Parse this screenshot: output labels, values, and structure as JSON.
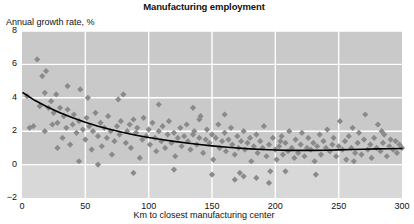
{
  "chart_data": {
    "type": "scatter",
    "title": "Manufacturing employment",
    "xlabel": "Km to closest manufacturing center",
    "ylabel": "Annual growth rate, %",
    "xlim": [
      0,
      300
    ],
    "ylim": [
      -2,
      8
    ],
    "xticks": [
      0,
      50,
      100,
      150,
      200,
      250,
      300
    ],
    "xtick_labels": [
      "0",
      "50",
      "100",
      "150",
      "200",
      "250",
      "300"
    ],
    "yticks": [
      -2,
      0,
      2,
      4,
      6,
      8
    ],
    "ytick_labels": [
      "−2",
      "0",
      "2",
      "4",
      "6",
      "8"
    ],
    "grid": true,
    "grid_color": "#ffffff",
    "plot_bg": "#c9c9c9",
    "plot_bg_below_zero": "#d8d8d8",
    "marker_shape": "diamond",
    "marker_color": "#8a8a8a",
    "marker_size": 5,
    "legend": null,
    "series": [
      {
        "name": "Municipalities",
        "points": [
          [
            4,
            4.1
          ],
          [
            6,
            2.2
          ],
          [
            9,
            2.3
          ],
          [
            12,
            6.3
          ],
          [
            14,
            3.5
          ],
          [
            16,
            5.3
          ],
          [
            18,
            2.0
          ],
          [
            19,
            5.6
          ],
          [
            21,
            3.4
          ],
          [
            23,
            3.8
          ],
          [
            24,
            2.4
          ],
          [
            25,
            3.1
          ],
          [
            27,
            4.2
          ],
          [
            28,
            2.5
          ],
          [
            30,
            3.4
          ],
          [
            32,
            1.6
          ],
          [
            33,
            2.9
          ],
          [
            35,
            2.2
          ],
          [
            36,
            3.3
          ],
          [
            38,
            1.2
          ],
          [
            40,
            2.4
          ],
          [
            41,
            3.0
          ],
          [
            43,
            1.9
          ],
          [
            45,
            2.6
          ],
          [
            46,
            4.5
          ],
          [
            48,
            2.1
          ],
          [
            50,
            1.5
          ],
          [
            51,
            2.8
          ],
          [
            53,
            2.3
          ],
          [
            55,
            0.9
          ],
          [
            56,
            2.0
          ],
          [
            58,
            3.1
          ],
          [
            60,
            1.7
          ],
          [
            62,
            2.5
          ],
          [
            63,
            1.1
          ],
          [
            65,
            2.2
          ],
          [
            67,
            1.6
          ],
          [
            68,
            2.9
          ],
          [
            70,
            2.0
          ],
          [
            71,
            0.6
          ],
          [
            73,
            1.4
          ],
          [
            75,
            2.3
          ],
          [
            77,
            1.8
          ],
          [
            78,
            2.6
          ],
          [
            80,
            4.2
          ],
          [
            82,
            1.3
          ],
          [
            83,
            2.0
          ],
          [
            85,
            2.4
          ],
          [
            86,
            1.0
          ],
          [
            88,
            2.7
          ],
          [
            90,
            1.9
          ],
          [
            91,
            2.2
          ],
          [
            93,
            0.4
          ],
          [
            95,
            1.5
          ],
          [
            96,
            2.8
          ],
          [
            98,
            1.7
          ],
          [
            100,
            2.1
          ],
          [
            101,
            1.2
          ],
          [
            103,
            2.5
          ],
          [
            105,
            1.6
          ],
          [
            106,
            0.8
          ],
          [
            108,
            2.0
          ],
          [
            110,
            1.4
          ],
          [
            111,
            2.3
          ],
          [
            113,
            1.0
          ],
          [
            115,
            1.8
          ],
          [
            116,
            2.6
          ],
          [
            118,
            1.3
          ],
          [
            120,
            1.9
          ],
          [
            121,
            0.5
          ],
          [
            123,
            1.6
          ],
          [
            125,
            2.2
          ],
          [
            126,
            1.1
          ],
          [
            128,
            1.7
          ],
          [
            130,
            2.4
          ],
          [
            131,
            1.4
          ],
          [
            133,
            0.9
          ],
          [
            135,
            1.8
          ],
          [
            136,
            2.0
          ],
          [
            138,
            1.2
          ],
          [
            140,
            1.6
          ],
          [
            141,
            2.9
          ],
          [
            143,
            0.7
          ],
          [
            145,
            1.5
          ],
          [
            146,
            2.1
          ],
          [
            148,
            1.3
          ],
          [
            150,
            1.8
          ],
          [
            151,
            0.3
          ],
          [
            153,
            1.6
          ],
          [
            155,
            2.4
          ],
          [
            156,
            1.0
          ],
          [
            158,
            1.4
          ],
          [
            160,
            1.9
          ],
          [
            161,
            0.8
          ],
          [
            163,
            1.5
          ],
          [
            165,
            2.2
          ],
          [
            166,
            1.2
          ],
          [
            168,
            0.6
          ],
          [
            170,
            1.7
          ],
          [
            171,
            1.0
          ],
          [
            173,
            1.4
          ],
          [
            175,
            2.0
          ],
          [
            176,
            0.9
          ],
          [
            178,
            1.3
          ],
          [
            180,
            1.6
          ],
          [
            181,
            0.2
          ],
          [
            183,
            1.1
          ],
          [
            185,
            1.8
          ],
          [
            186,
            0.7
          ],
          [
            188,
            1.4
          ],
          [
            190,
            1.0
          ],
          [
            191,
            2.3
          ],
          [
            193,
            0.5
          ],
          [
            195,
            1.2
          ],
          [
            196,
            -0.4
          ],
          [
            198,
            1.6
          ],
          [
            200,
            0.9
          ],
          [
            201,
            0.3
          ],
          [
            203,
            1.1
          ],
          [
            205,
            1.7
          ],
          [
            206,
            0.6
          ],
          [
            208,
            1.3
          ],
          [
            210,
            0.8
          ],
          [
            211,
            2.0
          ],
          [
            213,
            1.0
          ],
          [
            215,
            0.4
          ],
          [
            216,
            1.5
          ],
          [
            218,
            0.7
          ],
          [
            220,
            1.2
          ],
          [
            221,
            1.9
          ],
          [
            223,
            0.5
          ],
          [
            225,
            1.0
          ],
          [
            226,
            1.6
          ],
          [
            228,
            0.9
          ],
          [
            230,
            1.3
          ],
          [
            231,
            0.2
          ],
          [
            233,
            1.1
          ],
          [
            235,
            1.8
          ],
          [
            236,
            0.6
          ],
          [
            238,
            1.4
          ],
          [
            240,
            1.0
          ],
          [
            241,
            2.1
          ],
          [
            243,
            0.8
          ],
          [
            245,
            1.2
          ],
          [
            246,
            1.6
          ],
          [
            248,
            0.5
          ],
          [
            250,
            1.1
          ],
          [
            251,
            2.6
          ],
          [
            253,
            0.9
          ],
          [
            255,
            1.4
          ],
          [
            256,
            0.3
          ],
          [
            258,
            1.7
          ],
          [
            260,
            1.0
          ],
          [
            261,
            2.2
          ],
          [
            263,
            0.7
          ],
          [
            265,
            1.3
          ],
          [
            266,
            1.9
          ],
          [
            268,
            0.6
          ],
          [
            270,
            1.5
          ],
          [
            271,
            3.0
          ],
          [
            273,
            0.9
          ],
          [
            275,
            1.2
          ],
          [
            276,
            0.4
          ],
          [
            278,
            1.6
          ],
          [
            280,
            1.0
          ],
          [
            281,
            2.4
          ],
          [
            283,
            0.8
          ],
          [
            285,
            1.3
          ],
          [
            286,
            1.8
          ],
          [
            288,
            0.5
          ],
          [
            290,
            1.1
          ],
          [
            291,
            1.5
          ],
          [
            293,
            0.9
          ],
          [
            295,
            1.4
          ],
          [
            296,
            0.7
          ],
          [
            298,
            1.2
          ],
          [
            108,
            3.6
          ],
          [
            135,
            3.4
          ],
          [
            160,
            3.0
          ],
          [
            195,
            -1.1
          ],
          [
            45,
            0.2
          ],
          [
            60,
            0.0
          ],
          [
            88,
            -0.5
          ],
          [
            120,
            -0.3
          ],
          [
            150,
            -0.6
          ],
          [
            168,
            -0.9
          ],
          [
            172,
            -0.5
          ],
          [
            175,
            -0.7
          ],
          [
            185,
            -0.8
          ],
          [
            208,
            -0.4
          ],
          [
            232,
            -0.6
          ],
          [
            36,
            4.7
          ],
          [
            52,
            4.0
          ],
          [
            76,
            3.9
          ],
          [
            28,
            1.0
          ],
          [
            18,
            4.3
          ],
          [
            140,
            2.7
          ],
          [
            204,
            1.4
          ],
          [
            262,
            0.2
          ],
          [
            284,
            2.0
          ],
          [
            300,
            1.0
          ]
        ]
      }
    ],
    "trend_line": {
      "name": "Fitted trend",
      "color": "#000000",
      "width": 1.6,
      "points": [
        [
          0.8,
          4.3
        ],
        [
          10,
          3.85
        ],
        [
          20,
          3.45
        ],
        [
          30,
          3.1
        ],
        [
          40,
          2.8
        ],
        [
          50,
          2.53
        ],
        [
          60,
          2.3
        ],
        [
          70,
          2.1
        ],
        [
          80,
          1.92
        ],
        [
          90,
          1.76
        ],
        [
          100,
          1.62
        ],
        [
          110,
          1.5
        ],
        [
          120,
          1.39
        ],
        [
          130,
          1.29
        ],
        [
          140,
          1.2
        ],
        [
          150,
          1.12
        ],
        [
          160,
          1.05
        ],
        [
          170,
          0.99
        ],
        [
          180,
          0.94
        ],
        [
          190,
          0.9
        ],
        [
          200,
          0.87
        ],
        [
          210,
          0.85
        ],
        [
          220,
          0.85
        ],
        [
          230,
          0.85
        ],
        [
          240,
          0.86
        ],
        [
          250,
          0.88
        ],
        [
          260,
          0.9
        ],
        [
          270,
          0.92
        ],
        [
          280,
          0.94
        ],
        [
          290,
          0.95
        ],
        [
          300,
          0.96
        ]
      ]
    }
  }
}
